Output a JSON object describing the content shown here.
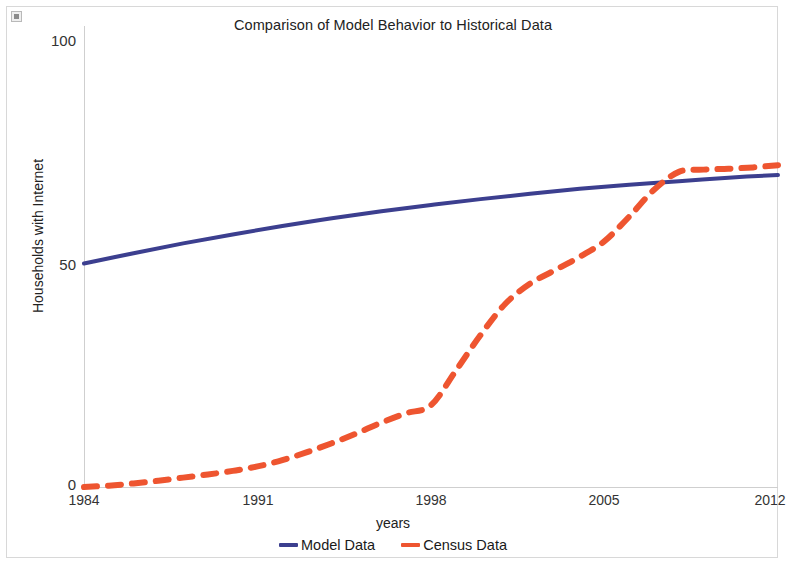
{
  "chart_data": {
    "type": "line",
    "title": "Comparison of Model Behavior to Historical Data",
    "xlabel": "years",
    "ylabel": "Households with Internet",
    "xlim": [
      1984,
      2012
    ],
    "ylim": [
      0,
      100
    ],
    "xticks": [
      "1984",
      "1991",
      "1998",
      "2005",
      "2012"
    ],
    "yticks": [
      "0",
      "50",
      "100"
    ],
    "grid": false,
    "legend_position": "bottom-center",
    "series": [
      {
        "name": "Model Data",
        "color": "#3c3f8f",
        "style": "solid",
        "x": [
          1984,
          1986,
          1988,
          1990,
          1992,
          1994,
          1996,
          1998,
          2000,
          2002,
          2004,
          2006,
          2008,
          2010,
          2012
        ],
        "values": [
          50.0,
          52.3,
          54.5,
          56.5,
          58.4,
          60.1,
          61.7,
          63.1,
          64.4,
          65.6,
          66.7,
          67.6,
          68.4,
          69.2,
          69.8
        ]
      },
      {
        "name": "Census Data",
        "color": "#ee5530",
        "style": "dashed",
        "x": [
          1984,
          1985,
          1986,
          1987,
          1988,
          1989,
          1990,
          1991,
          1992,
          1993,
          1994,
          1995,
          1996,
          1997,
          1998,
          1999,
          2000,
          2001,
          2002,
          2003,
          2004,
          2005,
          2006,
          2007,
          2008,
          2009,
          2010,
          2011,
          2012
        ],
        "values": [
          0.0,
          0.3,
          0.8,
          1.4,
          2.1,
          2.8,
          3.6,
          4.6,
          6.0,
          7.8,
          9.8,
          12.0,
          14.4,
          16.5,
          18.3,
          26.0,
          34.0,
          41.0,
          45.5,
          48.5,
          51.5,
          55.0,
          60.5,
          66.5,
          70.5,
          71.0,
          71.2,
          71.5,
          72.0
        ]
      }
    ]
  },
  "legend": {
    "items": [
      {
        "label": "Model Data",
        "color": "#3c3f8f"
      },
      {
        "label": "Census Data",
        "color": "#ee5530"
      }
    ]
  },
  "icons": {
    "resize_handle": "resize-handle-icon"
  }
}
